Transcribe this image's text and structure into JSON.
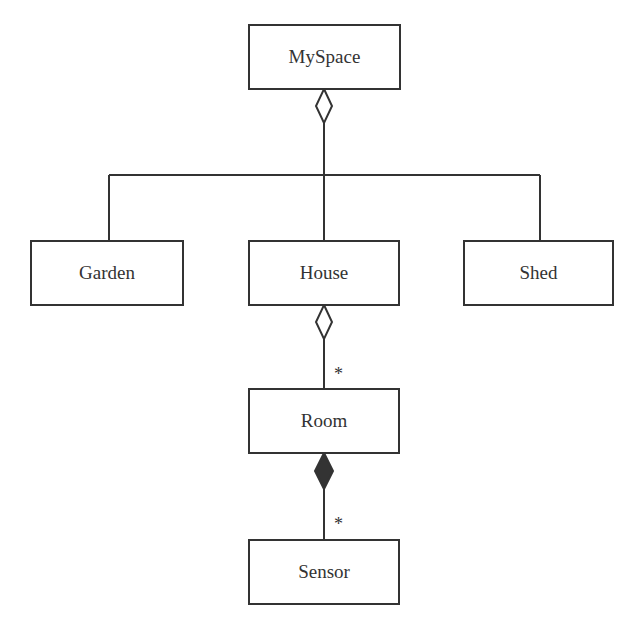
{
  "diagram": {
    "type": "UML class diagram",
    "classes": [
      {
        "id": "myspace",
        "label": "MySpace"
      },
      {
        "id": "garden",
        "label": "Garden"
      },
      {
        "id": "house",
        "label": "House"
      },
      {
        "id": "shed",
        "label": "Shed"
      },
      {
        "id": "room",
        "label": "Room"
      },
      {
        "id": "sensor",
        "label": "Sensor"
      }
    ],
    "relations": [
      {
        "from": "myspace",
        "to": [
          "garden",
          "house",
          "shed"
        ],
        "kind": "aggregation",
        "multiplicity": ""
      },
      {
        "from": "house",
        "to": "room",
        "kind": "aggregation",
        "multiplicity": "*"
      },
      {
        "from": "room",
        "to": "sensor",
        "kind": "composition",
        "multiplicity": "*"
      }
    ],
    "colors": {
      "line": "#333333",
      "background": "#ffffff"
    }
  }
}
